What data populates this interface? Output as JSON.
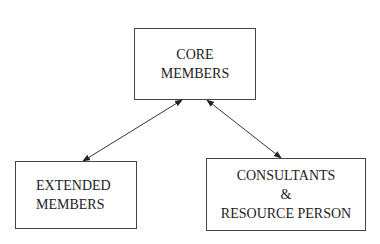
{
  "diagram": {
    "nodes": [
      {
        "id": "core",
        "lines": [
          "CORE",
          "MEMBERS"
        ]
      },
      {
        "id": "extended",
        "lines": [
          "EXTENDED",
          "MEMBERS"
        ]
      },
      {
        "id": "consultants",
        "lines": [
          "CONSULTANTS",
          "&",
          "RESOURCE PERSON"
        ]
      }
    ],
    "edges": [
      {
        "from": "core",
        "to": "extended",
        "type": "bidirectional"
      },
      {
        "from": "core",
        "to": "consultants",
        "type": "bidirectional"
      }
    ],
    "colors": {
      "line": "#333333",
      "background": "#ffffff"
    }
  }
}
